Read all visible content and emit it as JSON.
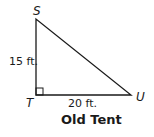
{
  "figure": {
    "title": "Old Tent",
    "vertices": {
      "S": {
        "label": "S",
        "x": 36,
        "y": 19
      },
      "T": {
        "label": "T",
        "x": 36,
        "y": 95
      },
      "U": {
        "label": "U",
        "x": 131,
        "y": 95
      }
    },
    "sides": {
      "ST": "15 ft.",
      "TU": "20 ft."
    },
    "right_angle_at": "T",
    "colors": {
      "stroke": "#1a1a1a",
      "background": "#ffffff"
    }
  }
}
